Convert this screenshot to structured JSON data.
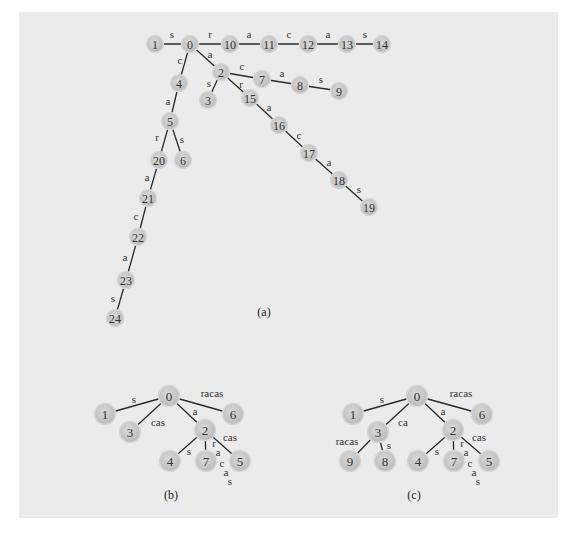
{
  "figure": {
    "background_color": "#ebebeb",
    "node_color": "#c6c6c6",
    "edge_color": "#2a2a2a",
    "trees": [
      {
        "id": "a",
        "caption": "(a)",
        "caption_pos": [
          264,
          312
        ],
        "node_radius": 8.5,
        "nodes": [
          {
            "id": "0",
            "x": 190,
            "y": 44
          },
          {
            "id": "1",
            "x": 155,
            "y": 44
          },
          {
            "id": "10",
            "x": 230,
            "y": 44
          },
          {
            "id": "11",
            "x": 269,
            "y": 44
          },
          {
            "id": "12",
            "x": 308,
            "y": 44
          },
          {
            "id": "13",
            "x": 347,
            "y": 44
          },
          {
            "id": "14",
            "x": 382,
            "y": 44
          },
          {
            "id": "2",
            "x": 221,
            "y": 72
          },
          {
            "id": "3",
            "x": 208,
            "y": 100
          },
          {
            "id": "7",
            "x": 262,
            "y": 79
          },
          {
            "id": "8",
            "x": 300,
            "y": 85
          },
          {
            "id": "9",
            "x": 339,
            "y": 91
          },
          {
            "id": "15",
            "x": 250,
            "y": 98
          },
          {
            "id": "16",
            "x": 279,
            "y": 125
          },
          {
            "id": "17",
            "x": 309,
            "y": 153
          },
          {
            "id": "18",
            "x": 339,
            "y": 180
          },
          {
            "id": "19",
            "x": 369,
            "y": 207
          },
          {
            "id": "4",
            "x": 179,
            "y": 83
          },
          {
            "id": "5",
            "x": 170,
            "y": 121
          },
          {
            "id": "6",
            "x": 183,
            "y": 160
          },
          {
            "id": "20",
            "x": 159,
            "y": 160
          },
          {
            "id": "21",
            "x": 148,
            "y": 198
          },
          {
            "id": "22",
            "x": 138,
            "y": 237
          },
          {
            "id": "23",
            "x": 126,
            "y": 280
          },
          {
            "id": "24",
            "x": 115,
            "y": 318
          }
        ],
        "edges": [
          {
            "from": "1",
            "to": "0",
            "label": "s",
            "lx": 172,
            "ly": 34
          },
          {
            "from": "0",
            "to": "10",
            "label": "r",
            "lx": 210,
            "ly": 34
          },
          {
            "from": "10",
            "to": "11",
            "label": "a",
            "lx": 249,
            "ly": 34
          },
          {
            "from": "11",
            "to": "12",
            "label": "c",
            "lx": 289,
            "ly": 34
          },
          {
            "from": "12",
            "to": "13",
            "label": "a",
            "lx": 328,
            "ly": 34
          },
          {
            "from": "13",
            "to": "14",
            "label": "s",
            "lx": 365,
            "ly": 34
          },
          {
            "from": "0",
            "to": "2",
            "label": "a",
            "lx": 210,
            "ly": 54
          },
          {
            "from": "2",
            "to": "3",
            "label": "s",
            "lx": 209,
            "ly": 83
          },
          {
            "from": "2",
            "to": "7",
            "label": "c",
            "lx": 242,
            "ly": 66
          },
          {
            "from": "7",
            "to": "8",
            "label": "a",
            "lx": 282,
            "ly": 73
          },
          {
            "from": "8",
            "to": "9",
            "label": "s",
            "lx": 321,
            "ly": 79
          },
          {
            "from": "2",
            "to": "15",
            "label": "r",
            "lx": 241,
            "ly": 84
          },
          {
            "from": "15",
            "to": "16",
            "label": "a",
            "lx": 269,
            "ly": 107
          },
          {
            "from": "16",
            "to": "17",
            "label": "c",
            "lx": 299,
            "ly": 135
          },
          {
            "from": "17",
            "to": "18",
            "label": "a",
            "lx": 329,
            "ly": 162
          },
          {
            "from": "18",
            "to": "19",
            "label": "s",
            "lx": 359,
            "ly": 189
          },
          {
            "from": "0",
            "to": "4",
            "label": "c",
            "lx": 180,
            "ly": 60
          },
          {
            "from": "4",
            "to": "5",
            "label": "a",
            "lx": 168,
            "ly": 101
          },
          {
            "from": "5",
            "to": "6",
            "label": "s",
            "lx": 182,
            "ly": 139
          },
          {
            "from": "5",
            "to": "20",
            "label": "r",
            "lx": 157,
            "ly": 137
          },
          {
            "from": "20",
            "to": "21",
            "label": "a",
            "lx": 147,
            "ly": 177
          },
          {
            "from": "21",
            "to": "22",
            "label": "c",
            "lx": 136,
            "ly": 216
          },
          {
            "from": "22",
            "to": "23",
            "label": "a",
            "lx": 125,
            "ly": 257
          },
          {
            "from": "23",
            "to": "24",
            "label": "s",
            "lx": 113,
            "ly": 298
          }
        ]
      },
      {
        "id": "b",
        "caption": "(b)",
        "caption_pos": [
          171,
          495
        ],
        "node_radius": 10.5,
        "nodes": [
          {
            "id": "0",
            "x": 169,
            "y": 396
          },
          {
            "id": "1",
            "x": 105,
            "y": 414
          },
          {
            "id": "3",
            "x": 130,
            "y": 432
          },
          {
            "id": "6",
            "x": 233,
            "y": 414
          },
          {
            "id": "2",
            "x": 205,
            "y": 430
          },
          {
            "id": "4",
            "x": 170,
            "y": 461
          },
          {
            "id": "7",
            "x": 206,
            "y": 461
          },
          {
            "id": "5",
            "x": 240,
            "y": 461
          }
        ],
        "edges": [
          {
            "from": "0",
            "to": "1",
            "label": "s",
            "lx": 134,
            "ly": 399
          },
          {
            "from": "0",
            "to": "3",
            "label": "cas",
            "lx": 158,
            "ly": 422
          },
          {
            "from": "0",
            "to": "6",
            "label": "racas",
            "lx": 212,
            "ly": 393
          },
          {
            "from": "0",
            "to": "2",
            "label": "a",
            "lx": 195,
            "ly": 411
          },
          {
            "from": "2",
            "to": "4",
            "label": "s",
            "lx": 189,
            "ly": 451
          },
          {
            "from": "2",
            "to": "7",
            "label": "",
            "lx": 0,
            "ly": 0
          },
          {
            "from": "2",
            "to": "5",
            "label": "cas",
            "lx": 230,
            "ly": 437
          }
        ],
        "stacked_labels": [
          {
            "chars": [
              "r",
              "a",
              "c",
              "a",
              "s"
            ],
            "positions": [
              [
                214,
                443
              ],
              [
                218,
                452
              ],
              [
                222,
                463
              ],
              [
                226,
                472
              ],
              [
                230,
                481
              ]
            ]
          }
        ]
      },
      {
        "id": "c",
        "caption": "(c)",
        "caption_pos": [
          414,
          495
        ],
        "node_radius": 10.5,
        "nodes": [
          {
            "id": "0",
            "x": 417,
            "y": 396
          },
          {
            "id": "1",
            "x": 353,
            "y": 414
          },
          {
            "id": "6",
            "x": 482,
            "y": 414
          },
          {
            "id": "3",
            "x": 378,
            "y": 432
          },
          {
            "id": "2",
            "x": 453,
            "y": 430
          },
          {
            "id": "9",
            "x": 350,
            "y": 461
          },
          {
            "id": "8",
            "x": 385,
            "y": 461
          },
          {
            "id": "4",
            "x": 418,
            "y": 461
          },
          {
            "id": "7",
            "x": 454,
            "y": 461
          },
          {
            "id": "5",
            "x": 489,
            "y": 461
          }
        ],
        "edges": [
          {
            "from": "0",
            "to": "1",
            "label": "s",
            "lx": 382,
            "ly": 399
          },
          {
            "from": "0",
            "to": "3",
            "label": "ca",
            "lx": 403,
            "ly": 422
          },
          {
            "from": "0",
            "to": "6",
            "label": "racas",
            "lx": 461,
            "ly": 393
          },
          {
            "from": "0",
            "to": "2",
            "label": "a",
            "lx": 443,
            "ly": 411
          },
          {
            "from": "3",
            "to": "9",
            "label": "racas",
            "lx": 347,
            "ly": 441
          },
          {
            "from": "3",
            "to": "8",
            "label": "s",
            "lx": 389,
            "ly": 445
          },
          {
            "from": "2",
            "to": "4",
            "label": "s",
            "lx": 437,
            "ly": 451
          },
          {
            "from": "2",
            "to": "7",
            "label": "",
            "lx": 0,
            "ly": 0
          },
          {
            "from": "2",
            "to": "5",
            "label": "cas",
            "lx": 479,
            "ly": 437
          }
        ],
        "stacked_labels": [
          {
            "chars": [
              "r",
              "a",
              "c",
              "a",
              "s"
            ],
            "positions": [
              [
                462,
                443
              ],
              [
                466,
                452
              ],
              [
                470,
                463
              ],
              [
                474,
                472
              ],
              [
                478,
                481
              ]
            ]
          }
        ]
      }
    ]
  }
}
